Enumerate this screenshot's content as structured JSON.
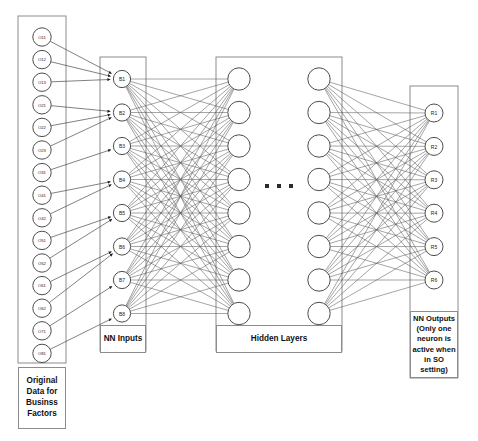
{
  "diagram": {
    "background": "#ffffff",
    "stroke_color": "#5a5a5a",
    "node_stroke": "#4d4d4d",
    "panel_stroke": "#8c8c8c"
  },
  "input_layer": {
    "caption": "Original Data for Businss Factors",
    "nodes": [
      {
        "label": "O11"
      },
      {
        "label": "O12"
      },
      {
        "label": "O13"
      },
      {
        "label": "O21"
      },
      {
        "label": "O22"
      },
      {
        "label": "O23"
      },
      {
        "label": "O31"
      },
      {
        "label": "O41"
      },
      {
        "label": "O42"
      },
      {
        "label": "O51"
      },
      {
        "label": "O52"
      },
      {
        "label": "O61"
      },
      {
        "label": "O62"
      },
      {
        "label": "O71"
      },
      {
        "label": "O81"
      }
    ]
  },
  "nn_inputs": {
    "caption": "NN Inputs",
    "nodes": [
      {
        "label": "B1"
      },
      {
        "label": "B2"
      },
      {
        "label": "B3"
      },
      {
        "label": "B4"
      },
      {
        "label": "B5"
      },
      {
        "label": "B6"
      },
      {
        "label": "B7"
      },
      {
        "label": "B8"
      }
    ]
  },
  "hidden_layers": {
    "caption": "Hidden Layers",
    "ellipsis": "▪ ▪ ▪",
    "column_count": 2,
    "nodes_per_column": 8,
    "node_labels": []
  },
  "output_layer": {
    "caption": "NN Outputs (Only one neuron is active when in SO setting)",
    "nodes": [
      {
        "label": "R1"
      },
      {
        "label": "R2"
      },
      {
        "label": "R3"
      },
      {
        "label": "R4"
      },
      {
        "label": "R5"
      },
      {
        "label": "R6"
      }
    ]
  },
  "connections": {
    "input_to_b": [
      {
        "from": [
          "O11",
          "O12",
          "O13"
        ],
        "to": "B1"
      },
      {
        "from": [
          "O21",
          "O22",
          "O23"
        ],
        "to": "B2"
      },
      {
        "from": [
          "O31"
        ],
        "to": "B3"
      },
      {
        "from": [
          "O41",
          "O42"
        ],
        "to": "B4"
      },
      {
        "from": [
          "O51",
          "O52"
        ],
        "to": "B5"
      },
      {
        "from": [
          "O61",
          "O62"
        ],
        "to": "B6"
      },
      {
        "from": [
          "O71"
        ],
        "to": "B7"
      },
      {
        "from": [
          "O81"
        ],
        "to": "B8"
      }
    ],
    "b_to_hidden1": "fully-connected",
    "hidden2_to_output": "fully-connected"
  }
}
